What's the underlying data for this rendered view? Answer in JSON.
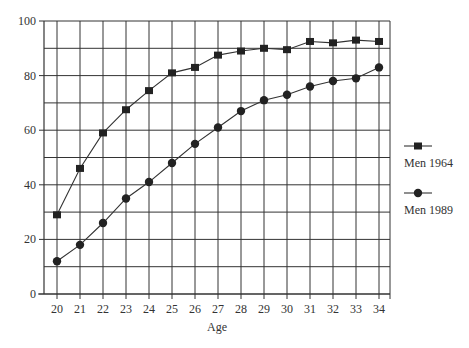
{
  "chart_data": {
    "type": "line",
    "title": "",
    "xlabel": "Age",
    "ylabel": "",
    "x": [
      20,
      21,
      22,
      23,
      24,
      25,
      26,
      27,
      28,
      29,
      30,
      31,
      32,
      33,
      34
    ],
    "ylim": [
      0,
      100
    ],
    "yticks": [
      0,
      20,
      40,
      60,
      80,
      100
    ],
    "grid": true,
    "legend_position": "right",
    "series": [
      {
        "name": "Men 1964",
        "marker": "square",
        "values": [
          29,
          46,
          59,
          67.5,
          74.5,
          81,
          83,
          87.5,
          89,
          90,
          89.5,
          92.5,
          92,
          93,
          92.5
        ]
      },
      {
        "name": "Men 1989",
        "marker": "circle",
        "values": [
          12,
          18,
          26,
          35,
          41,
          48,
          55,
          61,
          67,
          71,
          73,
          76,
          78,
          79,
          83
        ]
      }
    ]
  },
  "colors": {
    "line": "#333333",
    "grid": "#333333",
    "marker": "#222222"
  }
}
